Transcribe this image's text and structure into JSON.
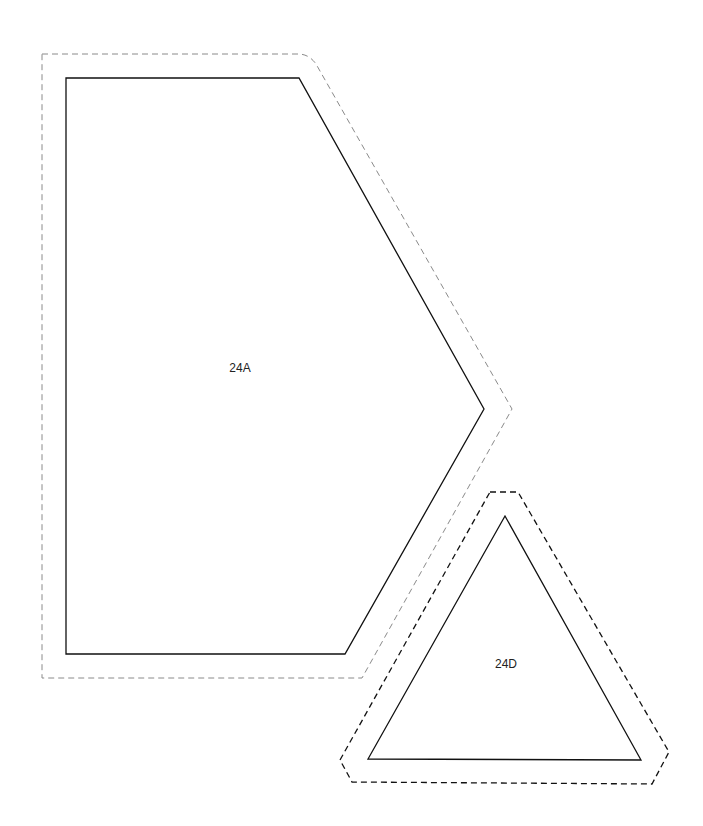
{
  "page": {
    "background": "#ffffff"
  },
  "pieces": [
    {
      "id": "piece-24a",
      "label": "24A",
      "label_pos": [
        240,
        372
      ],
      "cut_line": {
        "points": "66,78 299,78 484,409 345,654 66,654",
        "color": "#111111"
      },
      "seam_allowance": {
        "path": "M42,54 L298,54 Q309,54 316,64 L512,409 L362,678 L42,678 Z",
        "color": "#8a8a8a",
        "style": "dashed"
      }
    },
    {
      "id": "piece-24d",
      "label": "24D",
      "label_pos": [
        506,
        668
      ],
      "cut_line": {
        "points": "505,516 368,759 641,760",
        "color": "#111111"
      },
      "seam_allowance": {
        "path": "M490,492 L518,492 L669,752 L652,784 L352,782 L340,760 Z",
        "color": "#111111",
        "style": "dashed"
      }
    }
  ]
}
